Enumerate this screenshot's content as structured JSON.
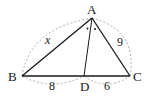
{
  "diagram": {
    "type": "triangle-angle-bisector",
    "vertices": {
      "A": {
        "label": "A",
        "x": 92,
        "y": 18
      },
      "B": {
        "label": "B",
        "x": 22,
        "y": 76
      },
      "C": {
        "label": "C",
        "x": 130,
        "y": 76
      },
      "D": {
        "label": "D",
        "x": 84,
        "y": 76
      }
    },
    "labels": {
      "AB": "x",
      "AC": "9",
      "BD": "8",
      "DC": "6"
    },
    "angle_marks": "•  •",
    "colors": {
      "stroke": "#1a1a1a",
      "dashed": "#9a9a9a"
    }
  }
}
